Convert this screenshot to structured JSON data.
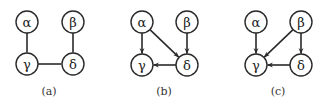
{
  "figure": {
    "node_radius": 11,
    "stroke_color": "#2a2a2a",
    "panels": [
      {
        "id": "a",
        "caption": "(a)",
        "caption_pos": [
          49,
          95
        ],
        "nodes": [
          {
            "id": "alpha",
            "label": "α",
            "x": 27,
            "y": 22
          },
          {
            "id": "beta",
            "label": "β",
            "x": 73,
            "y": 22
          },
          {
            "id": "gamma",
            "label": "γ",
            "x": 27,
            "y": 64
          },
          {
            "id": "delta",
            "label": "δ",
            "x": 73,
            "y": 64
          }
        ],
        "edges": [
          {
            "from": "alpha",
            "to": "gamma",
            "directed": false
          },
          {
            "from": "beta",
            "to": "delta",
            "directed": false
          },
          {
            "from": "gamma",
            "to": "delta",
            "directed": false
          }
        ]
      },
      {
        "id": "b",
        "caption": "(b)",
        "caption_pos": [
          164,
          95
        ],
        "nodes": [
          {
            "id": "alpha",
            "label": "α",
            "x": 142,
            "y": 22
          },
          {
            "id": "beta",
            "label": "β",
            "x": 187,
            "y": 22
          },
          {
            "id": "gamma",
            "label": "γ",
            "x": 142,
            "y": 65
          },
          {
            "id": "delta",
            "label": "δ",
            "x": 187,
            "y": 65
          }
        ],
        "edges": [
          {
            "from": "alpha",
            "to": "gamma",
            "directed": true
          },
          {
            "from": "alpha",
            "to": "delta",
            "directed": true
          },
          {
            "from": "beta",
            "to": "delta",
            "directed": true
          },
          {
            "from": "delta",
            "to": "gamma",
            "directed": true
          }
        ]
      },
      {
        "id": "c",
        "caption": "(c)",
        "caption_pos": [
          278,
          95
        ],
        "nodes": [
          {
            "id": "alpha",
            "label": "α",
            "x": 256,
            "y": 22
          },
          {
            "id": "beta",
            "label": "β",
            "x": 301,
            "y": 22
          },
          {
            "id": "gamma",
            "label": "γ",
            "x": 256,
            "y": 65
          },
          {
            "id": "delta",
            "label": "δ",
            "x": 301,
            "y": 65
          }
        ],
        "edges": [
          {
            "from": "alpha",
            "to": "gamma",
            "directed": true
          },
          {
            "from": "beta",
            "to": "gamma",
            "directed": true
          },
          {
            "from": "beta",
            "to": "delta",
            "directed": true
          },
          {
            "from": "delta",
            "to": "gamma",
            "directed": true
          }
        ]
      }
    ]
  }
}
